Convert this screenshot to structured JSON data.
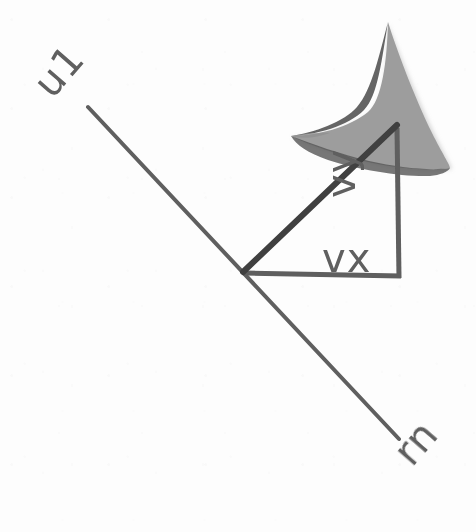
{
  "figure": {
    "background_color": "#fdfdfd",
    "ink_color": "#5e5e5e",
    "arrowhead_fill": "#9a9a9a",
    "arrowhead_edge": "#4f4f4f",
    "labels": [
      {
        "id": "u1",
        "text": "u1",
        "x": 52,
        "y": 100,
        "rotation": -49,
        "role": "axis-end-label-upper-left"
      },
      {
        "id": "rn",
        "text": "rn",
        "x": 412,
        "y": 468,
        "rotation": -49,
        "role": "axis-end-label-lower-right"
      },
      {
        "id": "vy",
        "text": "vy",
        "x": 380,
        "y": 200,
        "rotation": -90,
        "role": "vertical-component-label"
      },
      {
        "id": "vx",
        "text": "vx",
        "x": 322,
        "y": 272,
        "rotation": 0,
        "role": "horizontal-component-label"
      }
    ],
    "geometry": {
      "axis_line": {
        "x1": 88,
        "y1": 107,
        "x2": 399,
        "y2": 439,
        "stroke_width": 4
      },
      "origin_vertex": {
        "x": 243,
        "y": 273
      },
      "right_angle_vertex": {
        "x": 400,
        "y": 277
      },
      "apex_vertex": {
        "x": 396,
        "y": 127
      },
      "horizontal_leg": {
        "x1": 243,
        "y1": 273,
        "x2": 400,
        "y2": 276,
        "stroke_width": 5
      },
      "vertical_leg": {
        "x1": 399,
        "y1": 277,
        "x2": 397,
        "y2": 128,
        "stroke_width": 5
      },
      "hypotenuse_vector": {
        "x1": 243,
        "y1": 272,
        "x2": 397,
        "y2": 126,
        "stroke_width": 6
      },
      "arrowhead_tip": {
        "x": 388,
        "y": 22
      }
    }
  }
}
